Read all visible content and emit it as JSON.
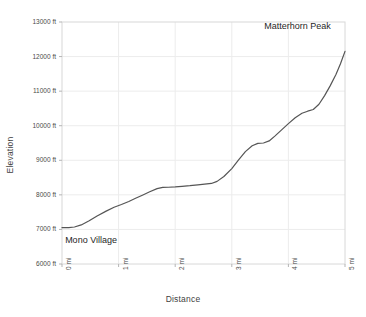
{
  "chart_data": {
    "type": "line",
    "title": "",
    "xlabel": "Distance",
    "ylabel": "Elevation",
    "xlim": [
      0,
      5
    ],
    "ylim": [
      6000,
      13000
    ],
    "grid": true,
    "legend": "none",
    "x_unit": "mi",
    "y_unit": "ft",
    "x_tick_labels": [
      "0 mi",
      "1 mi",
      "2 mi",
      "3 mi",
      "4 mi",
      "5 mi"
    ],
    "x_tick_values": [
      0,
      1,
      2,
      3,
      4,
      5
    ],
    "y_tick_labels": [
      "6000 ft",
      "7000 ft",
      "8000 ft",
      "9000 ft",
      "10000 ft",
      "11000 ft",
      "12000 ft",
      "13000 ft"
    ],
    "y_tick_values": [
      6000,
      7000,
      8000,
      9000,
      10000,
      11000,
      12000,
      13000
    ],
    "series": [
      {
        "name": "Elevation profile",
        "color": "#555555",
        "x": [
          0.0,
          0.12,
          0.22,
          0.34,
          0.48,
          0.62,
          0.78,
          0.92,
          1.05,
          1.18,
          1.3,
          1.42,
          1.55,
          1.68,
          1.78,
          1.88,
          2.0,
          2.12,
          2.26,
          2.4,
          2.52,
          2.64,
          2.74,
          2.86,
          3.0,
          3.12,
          3.24,
          3.36,
          3.46,
          3.56,
          3.66,
          3.76,
          3.88,
          4.0,
          4.12,
          4.24,
          4.34,
          4.44,
          4.54,
          4.64,
          4.74,
          4.84,
          4.92,
          5.0
        ],
        "y": [
          7050,
          7055,
          7070,
          7130,
          7250,
          7390,
          7530,
          7640,
          7720,
          7810,
          7900,
          7990,
          8090,
          8180,
          8215,
          8220,
          8230,
          8245,
          8265,
          8290,
          8310,
          8330,
          8390,
          8530,
          8760,
          9010,
          9250,
          9420,
          9490,
          9500,
          9560,
          9700,
          9880,
          10060,
          10230,
          10360,
          10420,
          10470,
          10620,
          10870,
          11160,
          11480,
          11790,
          12150
        ]
      }
    ],
    "annotations": [
      {
        "text": "Mono Village",
        "x": 0.02,
        "y": 7050,
        "placement": "below-right"
      },
      {
        "text": "Matterhorn Peak",
        "x": 4.95,
        "y": 12150,
        "placement": "above-left"
      }
    ]
  }
}
